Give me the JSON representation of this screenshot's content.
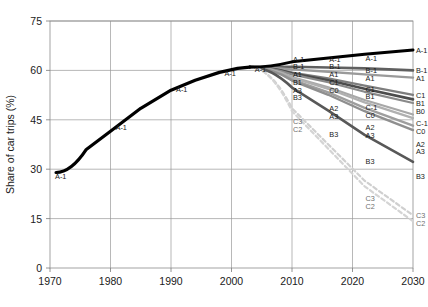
{
  "chart_data": {
    "type": "line",
    "title": "",
    "xlabel": "",
    "ylabel": "Share of car trips (%)",
    "xlim": [
      1970,
      2030
    ],
    "ylim": [
      0,
      75
    ],
    "xticks": [
      1970,
      1980,
      1990,
      2000,
      2010,
      2020,
      2030
    ],
    "yticks": [
      0,
      15,
      30,
      45,
      60,
      75
    ],
    "grid": true,
    "legend": "inline-labels-on-curves",
    "history": {
      "name": "A-1",
      "style": "solid",
      "color": "#000000",
      "width": 3.2,
      "points": [
        [
          1971,
          29.0
        ],
        [
          1976,
          36.0
        ],
        [
          1980,
          41.5
        ],
        [
          1985,
          48.5
        ],
        [
          1990,
          54.0
        ],
        [
          1994,
          57.0
        ],
        [
          1998,
          59.4
        ],
        [
          2001,
          60.6
        ],
        [
          2003,
          61.0
        ]
      ],
      "inline_labels": [
        {
          "text": "A-1",
          "x": 1971,
          "y": 29.0
        },
        {
          "text": "A-1",
          "x": 1981,
          "y": 44.0
        },
        {
          "text": "A-1",
          "x": 1991,
          "y": 55.5
        },
        {
          "text": "A-1",
          "x": 1999,
          "y": 60.5
        },
        {
          "text": "A-1",
          "x": 2004,
          "y": 61.7
        }
      ]
    },
    "branch_point": {
      "x": 2003,
      "y": 61.0
    },
    "series": [
      {
        "name": "A-1",
        "color": "#000000",
        "width": 3.0,
        "style": "solid",
        "x": [
          2003,
          2010,
          2016,
          2022,
          2030
        ],
        "values": [
          61.0,
          62.6,
          63.8,
          64.9,
          66.2
        ]
      },
      {
        "name": "B-1",
        "color": "#606060",
        "width": 2.6,
        "style": "solid",
        "x": [
          2003,
          2010,
          2016,
          2022,
          2030
        ],
        "values": [
          61.0,
          61.1,
          60.9,
          60.6,
          60.0
        ]
      },
      {
        "name": "A1",
        "color": "#9a9a9a",
        "width": 2.4,
        "style": "solid",
        "x": [
          2003,
          2010,
          2016,
          2022,
          2030
        ],
        "values": [
          61.0,
          60.3,
          59.6,
          58.8,
          57.8
        ]
      },
      {
        "name": "C1",
        "color": "#7d7d7d",
        "width": 2.3,
        "style": "solid",
        "x": [
          2003,
          2010,
          2016,
          2022,
          2030
        ],
        "values": [
          61.0,
          59.3,
          57.6,
          55.4,
          52.6
        ]
      },
      {
        "name": "B1",
        "color": "#4c4c4c",
        "width": 2.6,
        "style": "solid",
        "x": [
          2003,
          2010,
          2016,
          2022,
          2030
        ],
        "values": [
          61.0,
          59.1,
          57.0,
          54.4,
          51.2
        ]
      },
      {
        "name": "B0",
        "color": "#8a8a8a",
        "width": 2.2,
        "style": "solid",
        "x": [
          2003,
          2010,
          2016,
          2022,
          2030
        ],
        "values": [
          61.0,
          58.8,
          56.4,
          53.5,
          50.1
        ]
      },
      {
        "name": "C-1",
        "color": "#a8a8a8",
        "width": 2.2,
        "style": "solid",
        "x": [
          2003,
          2010,
          2016,
          2022,
          2030
        ],
        "values": [
          61.0,
          58.0,
          54.9,
          51.0,
          46.6
        ]
      },
      {
        "name": "C0",
        "color": "#b0b0b0",
        "width": 2.2,
        "style": "solid",
        "x": [
          2003,
          2010,
          2016,
          2022,
          2030
        ],
        "values": [
          61.0,
          57.8,
          54.4,
          50.3,
          45.5
        ]
      },
      {
        "name": "A2",
        "color": "#9e9e9e",
        "width": 2.4,
        "style": "solid",
        "x": [
          2003,
          2010,
          2016,
          2022,
          2030
        ],
        "values": [
          61.0,
          57.2,
          53.3,
          48.6,
          43.2
        ]
      },
      {
        "name": "A3",
        "color": "#8f8f8f",
        "width": 2.4,
        "style": "solid",
        "x": [
          2003,
          2010,
          2016,
          2022,
          2030
        ],
        "values": [
          61.0,
          56.9,
          52.6,
          47.6,
          41.9
        ]
      },
      {
        "name": "B3",
        "color": "#585858",
        "width": 2.6,
        "style": "solid",
        "x": [
          2003,
          2010,
          2016,
          2022,
          2030
        ],
        "values": [
          61.0,
          54.8,
          47.8,
          40.4,
          32.2
        ]
      },
      {
        "name": "C3",
        "color": "#cfcfcf",
        "width": 2.2,
        "style": "dashed",
        "x": [
          2003,
          2010,
          2016,
          2022,
          2030
        ],
        "values": [
          61.0,
          48.5,
          37.5,
          26.5,
          16.0
        ]
      },
      {
        "name": "C2",
        "color": "#d4d4d4",
        "width": 2.2,
        "style": "dashed",
        "x": [
          2003,
          2010,
          2016,
          2022,
          2030
        ],
        "values": [
          61.0,
          47.6,
          36.2,
          24.8,
          14.2
        ]
      }
    ],
    "label_columns": [
      {
        "at_x": 2010,
        "labels": [
          {
            "text": "A-1",
            "y": 63.6
          },
          {
            "text": "B-1",
            "y": 61.3
          },
          {
            "text": "A1",
            "y": 58.9
          },
          {
            "text": "B1",
            "y": 56.6
          },
          {
            "text": "A3",
            "y": 54.2
          },
          {
            "text": "B3",
            "y": 51.8
          },
          {
            "text": "C3",
            "y": 44.6
          },
          {
            "text": "C2",
            "y": 42.2
          }
        ]
      },
      {
        "at_x": 2016,
        "labels": [
          {
            "text": "A-1",
            "y": 63.6
          },
          {
            "text": "B-1",
            "y": 61.3
          },
          {
            "text": "A1",
            "y": 58.9
          },
          {
            "text": "C1",
            "y": 56.6
          },
          {
            "text": "C0",
            "y": 54.2
          },
          {
            "text": "A2",
            "y": 48.6
          },
          {
            "text": "A3",
            "y": 46.2
          },
          {
            "text": "B3",
            "y": 40.6
          }
        ]
      },
      {
        "at_x": 2022,
        "labels": [
          {
            "text": "A-1",
            "y": 63.9
          },
          {
            "text": "B-1",
            "y": 60.2
          },
          {
            "text": "A1",
            "y": 57.8
          },
          {
            "text": "C1",
            "y": 54.4
          },
          {
            "text": "B1",
            "y": 52.1
          },
          {
            "text": "C-1",
            "y": 49.0
          },
          {
            "text": "C0",
            "y": 46.6
          },
          {
            "text": "A2",
            "y": 42.8
          },
          {
            "text": "A3",
            "y": 40.4
          },
          {
            "text": "B3",
            "y": 32.6
          },
          {
            "text": "C3",
            "y": 21.3
          },
          {
            "text": "C2",
            "y": 18.9
          }
        ]
      },
      {
        "at_x": 2030,
        "labels": [
          {
            "text": "A-1",
            "y": 66.2
          },
          {
            "text": "B-1",
            "y": 60.0
          },
          {
            "text": "A1",
            "y": 57.6
          },
          {
            "text": "C1",
            "y": 52.6
          },
          {
            "text": "B1",
            "y": 50.2
          },
          {
            "text": "B0",
            "y": 47.8
          },
          {
            "text": "C-1",
            "y": 44.0
          },
          {
            "text": "C0",
            "y": 41.6
          },
          {
            "text": "A2",
            "y": 37.8
          },
          {
            "text": "A3",
            "y": 35.4
          },
          {
            "text": "B3",
            "y": 28.0
          },
          {
            "text": "C3",
            "y": 16.0
          },
          {
            "text": "C2",
            "y": 13.6
          }
        ]
      }
    ]
  }
}
